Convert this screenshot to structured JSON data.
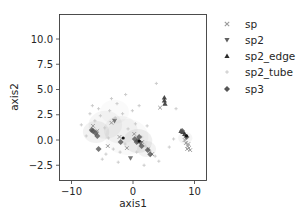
{
  "chart_data": {
    "type": "scatter",
    "title": "",
    "xlabel": "axis1",
    "ylabel": "axis2",
    "xlim": [
      -12,
      12
    ],
    "ylim": [
      -4,
      12.5
    ],
    "xticks": [
      -10,
      0,
      10
    ],
    "xtick_labels": [
      "−10",
      "0",
      "10"
    ],
    "yticks": [
      -2.5,
      0.0,
      2.5,
      5.0,
      7.5,
      10.0
    ],
    "ytick_labels": [
      "−2.5",
      "0.0",
      "2.5",
      "5.0",
      "7.5",
      "10.0"
    ],
    "grid": false,
    "legend_position": "outside-right-top",
    "series": [
      {
        "name": "sp",
        "marker": "x",
        "color": "#9a9a9a",
        "points": [
          [
            8.6,
            -0.3
          ],
          [
            8.9,
            -0.6
          ],
          [
            9.1,
            -0.8
          ],
          [
            9.3,
            -1.0
          ],
          [
            8.8,
            -0.9
          ],
          [
            9.0,
            -0.4
          ],
          [
            8.4,
            0.0
          ],
          [
            -6.5,
            1.4
          ],
          [
            -5.8,
            0.9
          ],
          [
            -3.5,
            1.7
          ],
          [
            -2.2,
            0.3
          ],
          [
            0.2,
            0.6
          ],
          [
            1.5,
            -0.2
          ],
          [
            2.5,
            -0.9
          ],
          [
            3.1,
            -1.4
          ],
          [
            -4.1,
            -0.6
          ],
          [
            -1.0,
            -0.8
          ],
          [
            4.4,
            3.2
          ]
        ]
      },
      {
        "name": "sp2",
        "marker": "v",
        "color": "#5f5f5f",
        "points": [
          [
            -0.4,
            -1.8
          ],
          [
            1.2,
            -0.3
          ],
          [
            -3.0,
            1.9
          ]
        ]
      },
      {
        "name": "sp2_edge",
        "marker": "^",
        "color": "#2b2b2b",
        "points": [
          [
            5.1,
            4.2
          ],
          [
            5.1,
            3.9
          ],
          [
            5.2,
            3.6
          ],
          [
            7.8,
            0.9
          ],
          [
            8.1,
            0.8
          ],
          [
            8.4,
            0.6
          ]
        ]
      },
      {
        "name": "sp2_tube",
        "marker": "+",
        "color": "#c8c8c8",
        "points": [
          [
            -7.0,
            2.6
          ],
          [
            -6.2,
            1.9
          ],
          [
            -5.3,
            2.4
          ],
          [
            -4.6,
            1.2
          ],
          [
            -3.8,
            2.9
          ],
          [
            -2.9,
            2.2
          ],
          [
            -1.7,
            2.6
          ],
          [
            -0.8,
            1.1
          ],
          [
            0.4,
            1.6
          ],
          [
            1.4,
            0.3
          ],
          [
            2.0,
            -0.6
          ],
          [
            2.8,
            -1.1
          ],
          [
            3.6,
            -1.6
          ],
          [
            -4.0,
            0.2
          ],
          [
            -3.2,
            -0.9
          ],
          [
            -2.1,
            -1.2
          ],
          [
            -1.3,
            -0.4
          ],
          [
            0.6,
            -1.2
          ],
          [
            -7.6,
            0.4
          ],
          [
            -6.6,
            3.4
          ],
          [
            -5.6,
            3.1
          ],
          [
            -3.5,
            4.1
          ],
          [
            -1.2,
            4.5
          ],
          [
            1.0,
            3.4
          ],
          [
            3.8,
            5.6
          ],
          [
            7.0,
            3.1
          ],
          [
            6.6,
            0.1
          ],
          [
            5.9,
            -0.7
          ],
          [
            -8.4,
            1.5
          ],
          [
            -5.0,
            -1.9
          ],
          [
            -2.4,
            -2.2
          ],
          [
            1.8,
            -2.5
          ],
          [
            4.2,
            -2.1
          ],
          [
            2.3,
            1.4
          ],
          [
            -0.1,
            2.9
          ],
          [
            -6.9,
            0.9
          ],
          [
            -4.4,
            -1.4
          ],
          [
            -2.6,
            3.6
          ]
        ]
      },
      {
        "name": "sp3",
        "marker": "D",
        "color": "#555555",
        "points": [
          [
            -5.6,
            -0.9
          ],
          [
            -6.1,
            0.7
          ],
          [
            -6.5,
            0.9
          ],
          [
            -5.8,
            0.4
          ],
          [
            -6.7,
            1.0
          ],
          [
            0.6,
            -0.2
          ],
          [
            1.0,
            0.3
          ],
          [
            0.3,
            0.1
          ],
          [
            1.4,
            -0.6
          ],
          [
            2.4,
            -1.0
          ],
          [
            2.8,
            -1.4
          ],
          [
            -2.0,
            -0.2
          ],
          [
            0.8,
            -0.1
          ],
          [
            8.0,
            0.9
          ],
          [
            8.7,
            0.3
          ]
        ]
      }
    ]
  },
  "legend": {
    "items": [
      {
        "label": "sp"
      },
      {
        "label": "sp2"
      },
      {
        "label": "sp2_edge"
      },
      {
        "label": "sp2_tube"
      },
      {
        "label": "sp3"
      }
    ]
  }
}
